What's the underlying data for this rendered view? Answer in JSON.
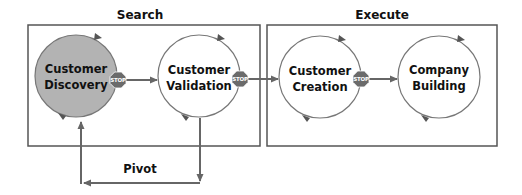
{
  "diagram": {
    "colors": {
      "box_border": "#555555",
      "circle_stroke": "#777777",
      "discovery_fill": "#b3b3b3",
      "arrow": "#666666",
      "stop_fill": "#6b6b6b",
      "text": "#111111"
    },
    "sections": [
      {
        "id": "search",
        "title": "Search"
      },
      {
        "id": "execute",
        "title": "Execute"
      }
    ],
    "stages": [
      {
        "id": "customer-discovery",
        "line1": "Customer",
        "line2": "Discovery",
        "highlighted": true
      },
      {
        "id": "customer-validation",
        "line1": "Customer",
        "line2": "Validation",
        "highlighted": false
      },
      {
        "id": "customer-creation",
        "line1": "Customer",
        "line2": "Creation",
        "highlighted": false
      },
      {
        "id": "company-building",
        "line1": "Company",
        "line2": "Building",
        "highlighted": false
      }
    ],
    "stop_signs": [
      {
        "text": "STOP"
      },
      {
        "text": "STOP"
      },
      {
        "text": "STOP"
      }
    ],
    "pivot": {
      "label": "Pivot"
    }
  }
}
